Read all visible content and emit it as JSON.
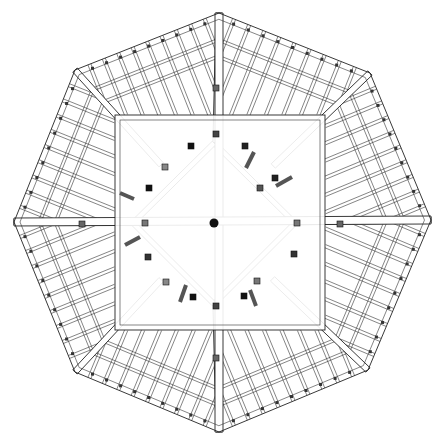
{
  "drawing": {
    "title": "Octagonal roof framing plan",
    "type": "architectural line drawing",
    "colors": {
      "line": "#222222",
      "background": "#ffffff",
      "block_dark": "#111111",
      "block_gray": "#777777"
    },
    "center": [
      214,
      223
    ],
    "outer_octagon": [
      [
        219,
        13
      ],
      [
        370,
        73
      ],
      [
        431,
        220
      ],
      [
        368,
        370
      ],
      [
        219,
        432
      ],
      [
        75,
        372
      ],
      [
        14,
        222
      ],
      [
        75,
        70
      ]
    ],
    "inner_square": {
      "x1": 115,
      "y1": 115,
      "x2": 325,
      "y2": 330
    },
    "inner_diamond": [
      [
        214,
        143
      ],
      [
        295,
        223
      ],
      [
        214,
        304
      ],
      [
        133,
        223
      ]
    ],
    "rafters_per_bay": 10,
    "purlin_rings": 2
  }
}
